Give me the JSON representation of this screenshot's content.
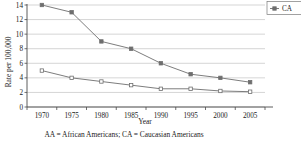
{
  "chart_data": {
    "type": "line",
    "title": "",
    "xlabel": "Year",
    "ylabel": "Rate per 100,000",
    "categories": [
      1970,
      1975,
      1980,
      1985,
      1990,
      1995,
      2000,
      2005
    ],
    "xtick_labels": [
      "1970",
      "1975",
      "1980",
      "1985",
      "1990",
      "1995",
      "2000",
      "2005"
    ],
    "ytick_labels": [
      "0",
      "2",
      "4",
      "6",
      "8",
      "10",
      "12",
      "14"
    ],
    "yticks": [
      0,
      2,
      4,
      6,
      8,
      10,
      12,
      14
    ],
    "ylim": [
      0,
      14
    ],
    "grid": "horizontal",
    "legend_position": "top-right-outside",
    "series": [
      {
        "name": "CA",
        "marker": "filled-square",
        "color": "#6e6e6e",
        "values": [
          14,
          13,
          9,
          8,
          6,
          4.5,
          4,
          3.4
        ]
      },
      {
        "name": "AA",
        "marker": "open-square",
        "color": "#6e6e6e",
        "values": [
          5,
          4,
          3.5,
          3,
          2.5,
          2.5,
          2.2,
          2.1
        ]
      }
    ],
    "legend_entries": [
      "CA"
    ],
    "caption": "AA = African Americans; CA = Caucasian Americans"
  },
  "colors": {
    "line": "#6e6e6e",
    "grid": "#b9b9b9",
    "axis": "#4a4a4a",
    "text": "#1a1a1a",
    "background": "#ffffff"
  }
}
